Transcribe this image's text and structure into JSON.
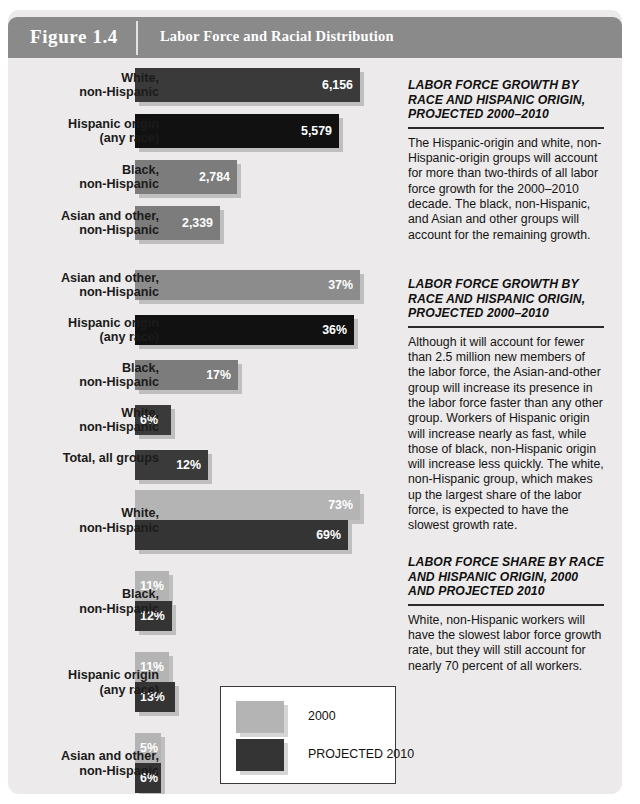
{
  "header": {
    "figure_number": "Figure 1.4",
    "title": "Labor Force and Racial Distribution"
  },
  "legend": {
    "items": [
      {
        "label": "2000",
        "color": "#b4b4b4"
      },
      {
        "label": "PROJECTED 2010",
        "color": "#343434"
      }
    ]
  },
  "sidebar": [
    {
      "heading": "LABOR FORCE GROWTH BY RACE AND HISPANIC ORIGIN, PROJECTED 2000–2010",
      "body": "The Hispanic-origin and white, non-Hispanic-origin groups will account for more than two-thirds of all labor force growth for the 2000–2010 decade. The black, non-Hispanic, and Asian and other groups will account for the remaining growth."
    },
    {
      "heading": "LABOR FORCE GROWTH BY RACE AND HISPANIC ORIGIN, PROJECTED 2000–2010",
      "body": "Although it will account for fewer than 2.5 million new members of the labor force, the Asian-and-other group will increase its presence in the labor force faster than any other group. Workers of Hispanic origin will increase nearly as fast, while those of black, non-Hispanic origin will increase less quickly. The white, non-Hispanic group, which makes up the largest share of the labor force, is expected to have the slowest growth rate."
    },
    {
      "heading": "LABOR FORCE SHARE BY RACE AND HISPANIC ORIGIN, 2000 AND PROJECTED 2010",
      "body": "White, non-Hispanic workers will have the slowest labor force growth rate, but they will still account for nearly 70 percent of all workers."
    }
  ],
  "chart_data": [
    {
      "type": "bar",
      "title": "Labor force growth by race and Hispanic origin, projected 2000-2010 (thousands)",
      "orientation": "horizontal",
      "categories": [
        "White, non-Hispanic",
        "Hispanic origin (any race)",
        "Black, non-Hispanic",
        "Asian and other, non-Hispanic"
      ],
      "values": [
        6156,
        5579,
        2784,
        2339
      ],
      "value_labels": [
        "6,156",
        "5,579",
        "2,784",
        "2,339"
      ],
      "colors": [
        "#3a3a3a",
        "#111111",
        "#7c7c7c",
        "#7c7c7c"
      ],
      "xlabel": "",
      "ylabel": "",
      "xlim": [
        0,
        6156
      ],
      "grid": false
    },
    {
      "type": "bar",
      "title": "Labor force growth rate by race and Hispanic origin, projected 2000-2010 (percent)",
      "orientation": "horizontal",
      "categories": [
        "Asian and other, non-Hispanic",
        "Hispanic origin (any race)",
        "Black, non-Hispanic",
        "White, non-Hispanic",
        "Total, all groups"
      ],
      "values": [
        37,
        36,
        17,
        6,
        12
      ],
      "value_labels": [
        "37%",
        "36%",
        "17%",
        "6%",
        "12%"
      ],
      "colors": [
        "#8c8c8c",
        "#111111",
        "#7c7c7c",
        "#3a3a3a",
        "#3a3a3a"
      ],
      "xlabel": "",
      "ylabel": "",
      "xlim": [
        0,
        37
      ],
      "grid": false
    },
    {
      "type": "bar",
      "title": "Labor force share by race and Hispanic origin, 2000 and projected 2010 (percent)",
      "orientation": "horizontal",
      "categories": [
        "White, non-Hispanic",
        "Black, non-Hispanic",
        "Hispanic origin (any race)",
        "Asian and other, non-Hispanic"
      ],
      "series": [
        {
          "name": "2000",
          "values": [
            73,
            11,
            11,
            5
          ],
          "value_labels": [
            "73%",
            "11%",
            "11%",
            "5%"
          ],
          "color": "#b4b4b4"
        },
        {
          "name": "PROJECTED 2010",
          "values": [
            69,
            12,
            13,
            6
          ],
          "value_labels": [
            "69%",
            "12%",
            "13%",
            "6%"
          ],
          "color": "#343434"
        }
      ],
      "xlabel": "",
      "ylabel": "",
      "xlim": [
        0,
        73
      ],
      "grid": false,
      "legend_position": "bottom-right"
    }
  ]
}
